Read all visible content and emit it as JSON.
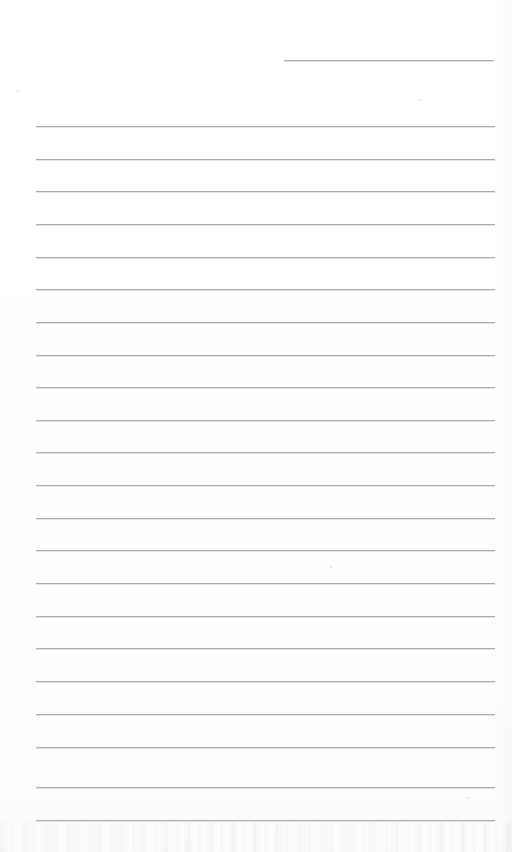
{
  "document": {
    "kind": "scanned-ruled-form-page",
    "title": "Blank ruled form page",
    "page_width": 512,
    "page_height": 852,
    "background_color": "#fefefe",
    "rule_color": "#aaaaaf",
    "rule_highlight_color": "#cdcdd2",
    "rule_thickness_px": 1,
    "visible_text": "",
    "body_text_lines": []
  },
  "header_rule": {
    "name": "top-short-rule",
    "description": "Short horizontal rule in the upper right area, like a date or signature field",
    "x_start": 284,
    "x_end": 494,
    "y": 60,
    "width": 210
  },
  "body_rules": {
    "name": "writing-lines",
    "description": "Full-width horizontal ruled writing lines",
    "count": 22,
    "x_start": 36,
    "x_end": 495,
    "width": 459,
    "first_y": 126,
    "spacing": 32.6,
    "y_positions": [
      126,
      159,
      191,
      224,
      257,
      289,
      322,
      355,
      387,
      420,
      452,
      485,
      518,
      550,
      583,
      616,
      648,
      681,
      714,
      747,
      787,
      820
    ]
  },
  "artifacts": {
    "name": "scan-artifacts",
    "specks": [
      {
        "x": 17,
        "y": 90,
        "size": 2
      },
      {
        "x": 419,
        "y": 99,
        "size": 2
      },
      {
        "x": 330,
        "y": 566,
        "size": 2
      },
      {
        "x": 467,
        "y": 797,
        "size": 2
      }
    ],
    "bottom_noise_height": 30,
    "right_margin_shade_width": 16
  }
}
